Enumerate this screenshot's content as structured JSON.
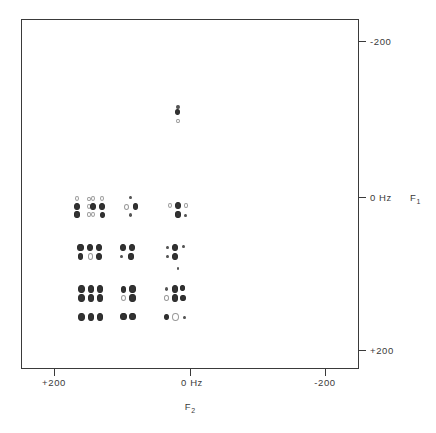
{
  "figure": {
    "kind": "2d-nmr-contour-spectrum",
    "background_color": "#ffffff",
    "line_color": "#3a3a3a",
    "peak_color": "#333333"
  },
  "chart_data": {
    "type": "scatter",
    "title": "",
    "subtitle": "",
    "xlabel": "F2",
    "ylabel": "F1",
    "xlabel_display": "F",
    "xlabel_sub": "2",
    "ylabel_display": "F",
    "ylabel_sub": "1",
    "x_unit": "Hz",
    "y_unit": "Hz",
    "xlim": [
      250,
      -250
    ],
    "ylim": [
      -250,
      250
    ],
    "grid": false,
    "legend": null,
    "x_ticks": [
      {
        "value": 200,
        "label": "+200"
      },
      {
        "value": 0,
        "label": "0 Hz"
      },
      {
        "value": -200,
        "label": "-200"
      }
    ],
    "y_ticks": [
      {
        "value": -200,
        "label": "-200"
      },
      {
        "value": 0,
        "label": "0 Hz F1"
      },
      {
        "value": 200,
        "label": "+200"
      }
    ],
    "y_tick_labels_plain": [
      "-200",
      "0 Hz",
      "+200"
    ],
    "clusters": [
      {
        "name": "isolated-top",
        "x_hz": 18,
        "y_hz": -120,
        "points": [
          {
            "dx": 0,
            "dy": -3,
            "r": 1.6,
            "style": "dot"
          },
          {
            "dx": 0,
            "dy": 2,
            "r": 2.4,
            "style": "filled"
          },
          {
            "dx": 0,
            "dy": 11,
            "r": 1.8,
            "style": "faint"
          }
        ]
      },
      {
        "name": "row1-col1",
        "x_hz": 160,
        "y_hz": 18,
        "points": [
          {
            "dx": -5,
            "dy": -8,
            "r": 2.0,
            "style": "faint"
          },
          {
            "dx": -5,
            "dy": 0,
            "r": 3.0,
            "style": "filled"
          },
          {
            "dx": -5,
            "dy": 8,
            "r": 2.6,
            "style": "filled"
          },
          {
            "dx": 7,
            "dy": -8,
            "r": 1.6,
            "style": "faint"
          },
          {
            "dx": 7,
            "dy": 0,
            "r": 2.0,
            "style": "faint"
          },
          {
            "dx": 7,
            "dy": 8,
            "r": 1.8,
            "style": "faint"
          }
        ]
      },
      {
        "name": "row1-col2",
        "x_hz": 136,
        "y_hz": 18,
        "points": [
          {
            "dx": -5,
            "dy": -8,
            "r": 2.0,
            "style": "faint"
          },
          {
            "dx": 4,
            "dy": -8,
            "r": 2.2,
            "style": "faint"
          },
          {
            "dx": -5,
            "dy": 0,
            "r": 2.8,
            "style": "filled"
          },
          {
            "dx": 4,
            "dy": 0,
            "r": 3.0,
            "style": "filled"
          },
          {
            "dx": -5,
            "dy": 8,
            "r": 2.2,
            "style": "faint"
          },
          {
            "dx": 4,
            "dy": 8,
            "r": 2.4,
            "style": "filled"
          }
        ]
      },
      {
        "name": "row1-col3",
        "x_hz": 88,
        "y_hz": 18,
        "points": [
          {
            "dx": 0,
            "dy": -9,
            "r": 1.4,
            "style": "dot"
          },
          {
            "dx": -4,
            "dy": 0,
            "r": 2.4,
            "style": "faint"
          },
          {
            "dx": 5,
            "dy": 0,
            "r": 2.8,
            "style": "filled"
          },
          {
            "dx": 0,
            "dy": 8,
            "r": 1.6,
            "style": "dot"
          }
        ]
      },
      {
        "name": "row1-col4",
        "x_hz": 18,
        "y_hz": 18,
        "points": [
          {
            "dx": -8,
            "dy": -1,
            "r": 2.2,
            "style": "faint"
          },
          {
            "dx": 0,
            "dy": -1,
            "r": 3.0,
            "style": "filled"
          },
          {
            "dx": 8,
            "dy": -1,
            "r": 1.8,
            "style": "faint"
          },
          {
            "dx": 0,
            "dy": 8,
            "r": 2.6,
            "style": "filled"
          },
          {
            "dx": 8,
            "dy": 9,
            "r": 1.4,
            "style": "dot"
          }
        ]
      },
      {
        "name": "row2-col1",
        "x_hz": 162,
        "y_hz": 82,
        "points": [
          {
            "dx": 0,
            "dy": -4,
            "r": 3.0,
            "style": "filled"
          },
          {
            "dx": 0,
            "dy": 5,
            "r": 2.6,
            "style": "filled"
          }
        ]
      },
      {
        "name": "row2-col2",
        "x_hz": 140,
        "y_hz": 82,
        "points": [
          {
            "dx": -5,
            "dy": -4,
            "r": 2.8,
            "style": "filled"
          },
          {
            "dx": 4,
            "dy": -4,
            "r": 2.8,
            "style": "filled"
          },
          {
            "dx": -5,
            "dy": 5,
            "r": 2.6,
            "style": "faint"
          },
          {
            "dx": 4,
            "dy": 5,
            "r": 2.8,
            "style": "filled"
          }
        ]
      },
      {
        "name": "row2-col3",
        "x_hz": 92,
        "y_hz": 82,
        "points": [
          {
            "dx": -5,
            "dy": -4,
            "r": 2.8,
            "style": "filled"
          },
          {
            "dx": 4,
            "dy": -4,
            "r": 2.8,
            "style": "filled"
          },
          {
            "dx": -6,
            "dy": 5,
            "r": 1.4,
            "style": "dot"
          },
          {
            "dx": 3,
            "dy": 5,
            "r": 2.6,
            "style": "filled"
          }
        ]
      },
      {
        "name": "row2-col4",
        "x_hz": 22,
        "y_hz": 82,
        "points": [
          {
            "dx": -8,
            "dy": -4,
            "r": 1.5,
            "style": "dot"
          },
          {
            "dx": 0,
            "dy": -4,
            "r": 2.8,
            "style": "filled"
          },
          {
            "dx": 8,
            "dy": -5,
            "r": 1.4,
            "style": "dot"
          },
          {
            "dx": -8,
            "dy": 5,
            "r": 1.4,
            "style": "dot"
          },
          {
            "dx": 0,
            "dy": 5,
            "r": 2.8,
            "style": "filled"
          },
          {
            "dx": 3,
            "dy": 17,
            "r": 1.3,
            "style": "dot"
          }
        ]
      },
      {
        "name": "row3-col1",
        "x_hz": 161,
        "y_hz": 143,
        "points": [
          {
            "dx": 0,
            "dy": -5,
            "r": 3.2,
            "style": "filled"
          },
          {
            "dx": 0,
            "dy": 4,
            "r": 3.2,
            "style": "filled"
          }
        ]
      },
      {
        "name": "row3-col2",
        "x_hz": 139,
        "y_hz": 143,
        "points": [
          {
            "dx": -5,
            "dy": -5,
            "r": 3.0,
            "style": "filled"
          },
          {
            "dx": 4,
            "dy": -5,
            "r": 3.0,
            "style": "filled"
          },
          {
            "dx": -5,
            "dy": 4,
            "r": 3.0,
            "style": "filled"
          },
          {
            "dx": 4,
            "dy": 4,
            "r": 3.0,
            "style": "filled"
          }
        ]
      },
      {
        "name": "row3-col3",
        "x_hz": 91,
        "y_hz": 143,
        "points": [
          {
            "dx": -5,
            "dy": -5,
            "r": 2.8,
            "style": "filled"
          },
          {
            "dx": 4,
            "dy": -5,
            "r": 3.0,
            "style": "filled"
          },
          {
            "dx": -5,
            "dy": 4,
            "r": 2.6,
            "style": "faint"
          },
          {
            "dx": 4,
            "dy": 4,
            "r": 3.0,
            "style": "filled"
          }
        ]
      },
      {
        "name": "row3-col4",
        "x_hz": 21,
        "y_hz": 143,
        "points": [
          {
            "dx": -9,
            "dy": -5,
            "r": 1.6,
            "style": "dot"
          },
          {
            "dx": -1,
            "dy": -5,
            "r": 3.0,
            "style": "filled"
          },
          {
            "dx": 7,
            "dy": -6,
            "r": 2.2,
            "style": "filled"
          },
          {
            "dx": -9,
            "dy": 4,
            "r": 2.2,
            "style": "faint"
          },
          {
            "dx": -1,
            "dy": 4,
            "r": 3.0,
            "style": "filled"
          },
          {
            "dx": 7,
            "dy": 4,
            "r": 2.6,
            "style": "filled"
          }
        ]
      },
      {
        "name": "row4-col1",
        "x_hz": 161,
        "y_hz": 175,
        "points": [
          {
            "dx": 0,
            "dy": 0,
            "r": 3.2,
            "style": "filled"
          }
        ]
      },
      {
        "name": "row4-col2",
        "x_hz": 139,
        "y_hz": 175,
        "points": [
          {
            "dx": -5,
            "dy": 0,
            "r": 3.2,
            "style": "filled"
          },
          {
            "dx": 4,
            "dy": 0,
            "r": 3.2,
            "style": "filled"
          }
        ]
      },
      {
        "name": "row4-col3",
        "x_hz": 91,
        "y_hz": 175,
        "points": [
          {
            "dx": -5,
            "dy": 0,
            "r": 3.0,
            "style": "filled"
          },
          {
            "dx": 4,
            "dy": 0,
            "r": 3.0,
            "style": "filled"
          }
        ]
      },
      {
        "name": "row4-col4",
        "x_hz": 21,
        "y_hz": 175,
        "points": [
          {
            "dx": -9,
            "dy": 0,
            "r": 2.4,
            "style": "filled"
          },
          {
            "dx": 0,
            "dy": 0,
            "r": 3.2,
            "style": "faint"
          },
          {
            "dx": 9,
            "dy": 1,
            "r": 1.4,
            "style": "dot"
          }
        ]
      }
    ]
  }
}
